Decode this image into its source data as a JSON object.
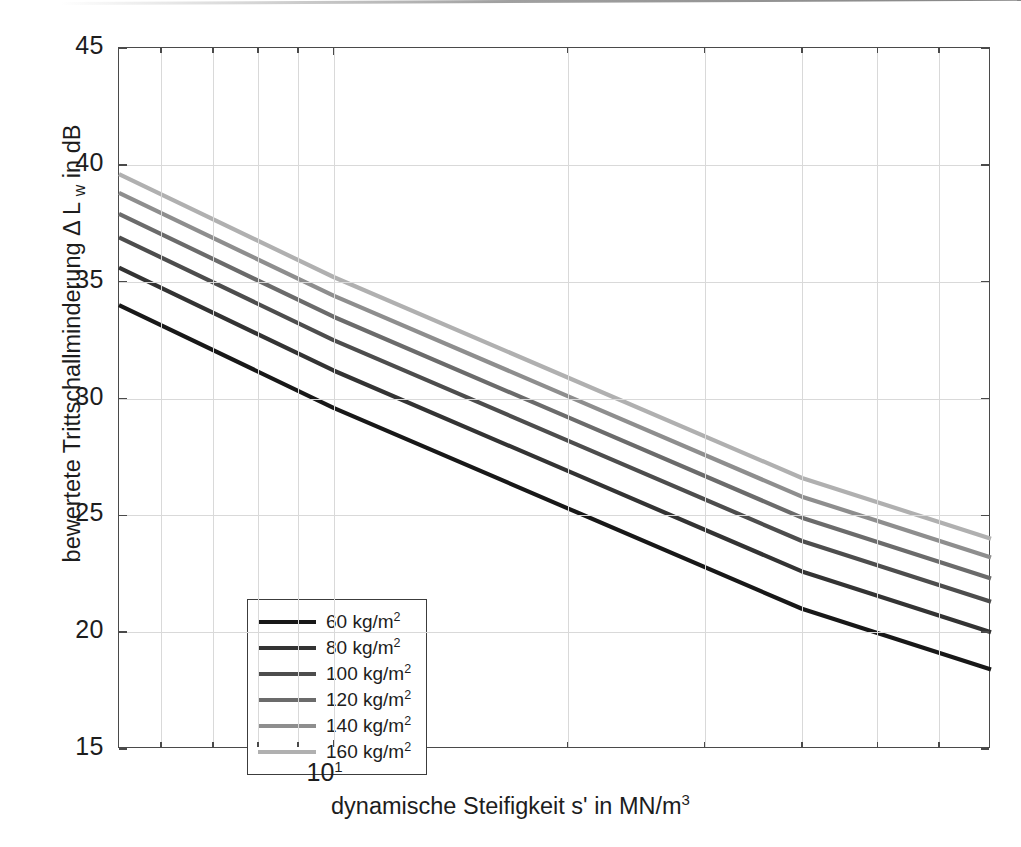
{
  "chart_data": {
    "type": "line",
    "title": "",
    "xlabel": "dynamische Steifigkeit s' in MN/m",
    "xlabel_sup": "3",
    "ylabel": "bewertete Trittschallminderung Δ L",
    "ylabel_sub": "w",
    "ylabel_tail": " in dB",
    "xscale": "log",
    "xlim": [
      5.3,
      70
    ],
    "ylim": [
      15,
      45
    ],
    "yticks": [
      15,
      20,
      25,
      30,
      35,
      40,
      45
    ],
    "ytick_labels": [
      "15",
      "20",
      "25",
      "30",
      "35",
      "40",
      "45"
    ],
    "xticks_major": [
      10
    ],
    "xtick_major_labels": [
      "10",
      "1"
    ],
    "xticks_minor": [
      6,
      7,
      8,
      9,
      20,
      30,
      40,
      50,
      60
    ],
    "grid": true,
    "legend_position": "lower left",
    "series": [
      {
        "name": "60 kg/m",
        "name_sup": "2",
        "color": "#181818",
        "x": [
          5.3,
          10,
          20,
          40,
          70
        ],
        "y": [
          34.0,
          29.6,
          25.3,
          21.0,
          18.4
        ]
      },
      {
        "name": "80 kg/m",
        "name_sup": "2",
        "color": "#333333",
        "x": [
          5.3,
          10,
          20,
          40,
          70
        ],
        "y": [
          35.6,
          31.2,
          26.9,
          22.6,
          20.0
        ]
      },
      {
        "name": "100 kg/m",
        "name_sup": "2",
        "color": "#4d4d4d",
        "x": [
          5.3,
          10,
          20,
          40,
          70
        ],
        "y": [
          36.9,
          32.5,
          28.2,
          23.9,
          21.3
        ]
      },
      {
        "name": "120 kg/m",
        "name_sup": "2",
        "color": "#6b6b6b",
        "x": [
          5.3,
          10,
          20,
          40,
          70
        ],
        "y": [
          37.9,
          33.5,
          29.2,
          24.9,
          22.3
        ]
      },
      {
        "name": "140 kg/m",
        "name_sup": "2",
        "color": "#8e8e8e",
        "x": [
          5.3,
          10,
          20,
          40,
          70
        ],
        "y": [
          38.8,
          34.4,
          30.1,
          25.8,
          23.2
        ]
      },
      {
        "name": "160 kg/m",
        "name_sup": "2",
        "color": "#b0b0b0",
        "x": [
          5.3,
          10,
          20,
          40,
          70
        ],
        "y": [
          39.6,
          35.2,
          30.9,
          26.6,
          24.0
        ]
      }
    ]
  }
}
